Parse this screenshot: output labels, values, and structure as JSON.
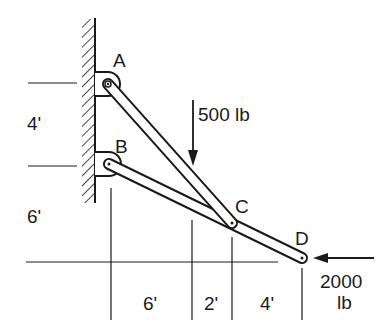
{
  "diagram": {
    "type": "truss-frame",
    "joints": {
      "A": {
        "label": "A"
      },
      "B": {
        "label": "B"
      },
      "C": {
        "label": "C"
      },
      "D": {
        "label": "D"
      }
    },
    "members": [
      {
        "from": "A",
        "to": "C"
      },
      {
        "from": "B",
        "to": "D"
      }
    ],
    "supports": [
      {
        "joint": "A",
        "type": "pin-wall"
      },
      {
        "joint": "B",
        "type": "pin-wall"
      }
    ],
    "loads": {
      "vertical": {
        "label": "500 lb",
        "direction": "down",
        "at": "member AC"
      },
      "horizontal": {
        "label_line1": "2000",
        "label_line2": "lb",
        "direction": "left",
        "at": "D"
      }
    },
    "dimensions": {
      "vertical": [
        {
          "label": "4'"
        },
        {
          "label": "6'"
        }
      ],
      "horizontal": [
        {
          "label": "6'"
        },
        {
          "label": "2'"
        },
        {
          "label": "4'"
        }
      ]
    },
    "colors": {
      "stroke": "#1a1a1a",
      "background": "#ffffff"
    }
  }
}
